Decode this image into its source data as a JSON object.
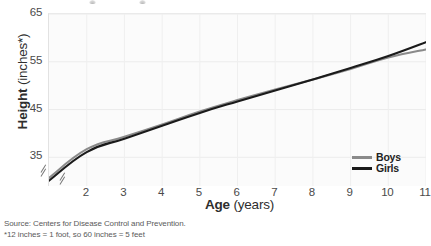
{
  "chart_data": {
    "type": "line",
    "title": "",
    "xlabel_bold": "Age",
    "xlabel_rest": "(years)",
    "ylabel_bold": "Height",
    "ylabel_rest": "(inches*)",
    "x": [
      1,
      2,
      3,
      4,
      5,
      6,
      7,
      8,
      9,
      10,
      11
    ],
    "xticks": [
      "2",
      "3",
      "4",
      "5",
      "6",
      "7",
      "8",
      "9",
      "10",
      "11"
    ],
    "yticks": [
      "35",
      "45",
      "55",
      "65"
    ],
    "ytick_values": [
      35,
      45,
      55,
      65
    ],
    "xlim": [
      1,
      11
    ],
    "ylim": [
      29,
      65
    ],
    "grid": true,
    "axis_break_x": true,
    "axis_break_y": true,
    "legend_position": "bottom-right",
    "series": [
      {
        "name": "Boys",
        "color": "#8a8a8a",
        "values": [
          30.7,
          36.7,
          39.3,
          41.9,
          44.6,
          47.0,
          49.2,
          51.3,
          53.5,
          55.9,
          57.6
        ]
      },
      {
        "name": "Girls",
        "color": "#1a1a1a",
        "values": [
          30.1,
          36.1,
          38.9,
          41.6,
          44.3,
          46.7,
          49.0,
          51.3,
          53.7,
          56.2,
          59.1
        ]
      }
    ]
  },
  "legend": {
    "items": [
      {
        "label": "Boys",
        "color": "#8a8a8a"
      },
      {
        "label": "Girls",
        "color": "#1a1a1a"
      }
    ]
  },
  "footnotes": {
    "source": "Source: Centers for Disease Control and Prevention.",
    "note": "*12 inches = 1 foot, so 60 inches = 5 feet"
  }
}
